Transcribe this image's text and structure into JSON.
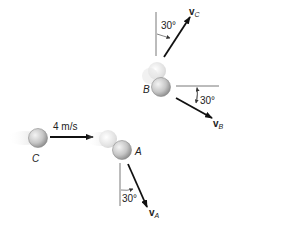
{
  "diagram": {
    "balls": {
      "C": {
        "label": "C"
      },
      "A": {
        "label": "A"
      },
      "B": {
        "label": "B"
      }
    },
    "initial_velocity": {
      "label": "4 m/s",
      "value": 4,
      "unit": "m/s"
    },
    "velocities": {
      "vA": {
        "symbol": "v",
        "subscript": "A",
        "angle_label": "30°",
        "angle_deg": 30,
        "reference": "vertical"
      },
      "vB": {
        "symbol": "v",
        "subscript": "B",
        "angle_label": "30°",
        "angle_deg": 30,
        "reference": "horizontal"
      },
      "vC": {
        "symbol": "v",
        "subscript": "C",
        "angle_label": "30°",
        "angle_deg": 30,
        "reference": "vertical"
      }
    },
    "colors": {
      "ball_fill": "#c8c8c8",
      "ball_edge": "#8a8a8a",
      "arrow": "#111111",
      "ref_line": "#555555"
    }
  }
}
